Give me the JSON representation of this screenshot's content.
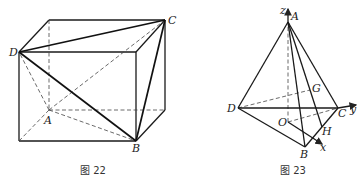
{
  "figures": [
    {
      "id": "fig22",
      "caption": "图 22",
      "type": "cuboid with inscribed tetrahedron",
      "vertex_labels": {
        "A": "A",
        "B": "B",
        "C": "C",
        "D": "D"
      }
    },
    {
      "id": "fig23",
      "caption": "图 23",
      "type": "tetrahedron with coordinate axes",
      "vertex_labels": {
        "A": "A",
        "B": "B",
        "C": "C",
        "D": "D",
        "O": "O",
        "G": "G",
        "H": "H"
      },
      "axis_labels": {
        "x": "x",
        "y": "y",
        "z": "z"
      }
    }
  ]
}
